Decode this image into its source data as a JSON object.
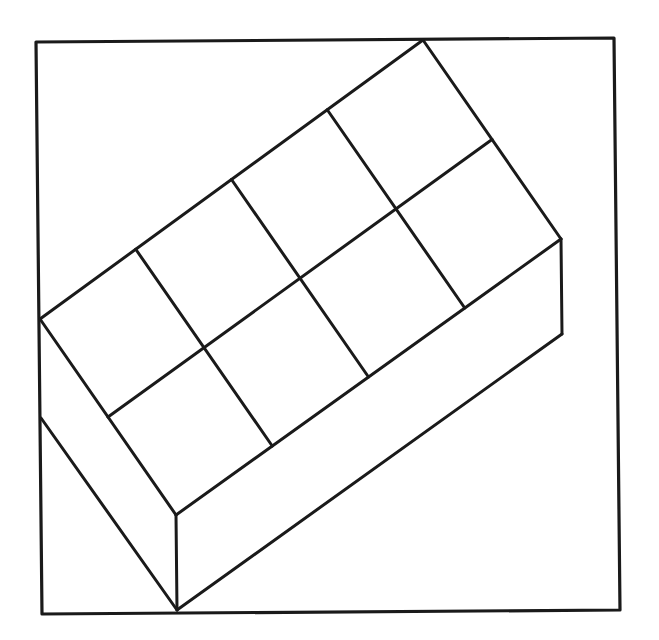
{
  "figure": {
    "type": "isometric-block-diagram",
    "colors": {
      "stroke": "#1a1a1a",
      "background": "#ffffff"
    },
    "frame": {
      "points": [
        [
          36,
          42
        ],
        [
          614,
          38
        ],
        [
          620,
          610
        ],
        [
          42,
          614
        ]
      ]
    },
    "top_face": {
      "corners": {
        "left": [
          40,
          319
        ],
        "top": [
          423,
          40
        ],
        "right": [
          561,
          239
        ],
        "front": [
          176,
          515
        ]
      },
      "grid": {
        "rows": 2,
        "cols": 4
      }
    },
    "box_height": 95
  }
}
